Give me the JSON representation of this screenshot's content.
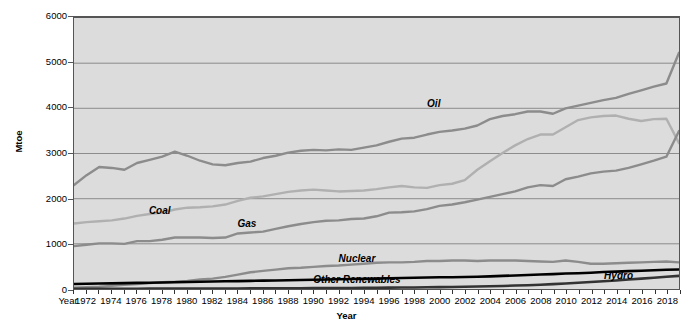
{
  "chart_data": {
    "type": "line",
    "title": "",
    "xlabel": "Year",
    "ylabel": "Mtoe",
    "xlim": [
      1971,
      2019
    ],
    "ylim": [
      0,
      6000
    ],
    "grid": true,
    "legend_position": "inline-labels",
    "background_color": "#dcdcdc",
    "y_ticks": [
      0,
      1000,
      2000,
      3000,
      4000,
      5000,
      6000
    ],
    "y_tick_labels": [
      "0",
      "1000",
      "2000",
      "3000",
      "4000",
      "5000",
      "6000"
    ],
    "x_axis_prefix_label": "Year",
    "x_tick_labels": [
      "1972",
      "1974",
      "1976",
      "1978",
      "1980",
      "1982",
      "1984",
      "1986",
      "1988",
      "1990",
      "1992",
      "1994",
      "1996",
      "1998",
      "2000",
      "2002",
      "2004",
      "2006",
      "2008",
      "2010",
      "2012",
      "2014",
      "2016",
      "2018"
    ],
    "x": [
      1971,
      1972,
      1973,
      1974,
      1975,
      1976,
      1977,
      1978,
      1979,
      1980,
      1981,
      1982,
      1983,
      1984,
      1985,
      1986,
      1987,
      1988,
      1989,
      1990,
      1991,
      1992,
      1993,
      1994,
      1995,
      1996,
      1997,
      1998,
      1999,
      2000,
      2001,
      2002,
      2003,
      2004,
      2005,
      2006,
      2007,
      2008,
      2009,
      2010,
      2011,
      2012,
      2013,
      2014,
      2015,
      2016,
      2017,
      2018,
      2019
    ],
    "series": [
      {
        "name": "Oil",
        "color": "#8c8c8c",
        "label_x": 1999,
        "label_y": 4180,
        "values": [
          2300,
          2520,
          2700,
          2680,
          2640,
          2790,
          2860,
          2930,
          3040,
          2950,
          2840,
          2760,
          2740,
          2790,
          2820,
          2900,
          2950,
          3020,
          3060,
          3080,
          3070,
          3090,
          3080,
          3130,
          3180,
          3260,
          3330,
          3350,
          3420,
          3480,
          3510,
          3550,
          3620,
          3760,
          3830,
          3870,
          3930,
          3930,
          3880,
          4000,
          4060,
          4120,
          4180,
          4230,
          4320,
          4400,
          4480,
          4550,
          5230
        ]
      },
      {
        "name": "Coal",
        "color": "#b0b0b0",
        "label_x": 1977,
        "label_y": 1830,
        "values": [
          1450,
          1480,
          1500,
          1520,
          1560,
          1620,
          1660,
          1690,
          1760,
          1800,
          1810,
          1830,
          1870,
          1950,
          2020,
          2050,
          2100,
          2150,
          2180,
          2200,
          2180,
          2160,
          2170,
          2180,
          2210,
          2250,
          2280,
          2250,
          2240,
          2300,
          2330,
          2410,
          2640,
          2830,
          3010,
          3180,
          3320,
          3420,
          3420,
          3580,
          3740,
          3800,
          3830,
          3840,
          3770,
          3720,
          3760,
          3770,
          3230
        ]
      },
      {
        "name": "Gas",
        "color": "#8c8c8c",
        "label_x": 1984,
        "label_y": 1560,
        "values": [
          950,
          980,
          1010,
          1010,
          1000,
          1060,
          1060,
          1090,
          1140,
          1140,
          1140,
          1130,
          1140,
          1230,
          1250,
          1270,
          1330,
          1390,
          1440,
          1480,
          1510,
          1520,
          1550,
          1560,
          1610,
          1690,
          1700,
          1720,
          1770,
          1840,
          1870,
          1920,
          1980,
          2040,
          2100,
          2160,
          2250,
          2300,
          2280,
          2430,
          2490,
          2560,
          2600,
          2620,
          2680,
          2760,
          2840,
          2930,
          3500
        ]
      },
      {
        "name": "Nuclear",
        "color": "#8c8c8c",
        "label_x": 1992,
        "label_y": 800,
        "values": [
          30,
          40,
          50,
          70,
          90,
          110,
          130,
          150,
          160,
          180,
          210,
          230,
          270,
          320,
          370,
          400,
          430,
          460,
          470,
          490,
          510,
          520,
          540,
          560,
          580,
          590,
          590,
          600,
          620,
          620,
          630,
          630,
          620,
          630,
          630,
          630,
          620,
          610,
          600,
          630,
          600,
          560,
          560,
          570,
          580,
          590,
          600,
          610,
          590
        ]
      },
      {
        "name": "Hydro",
        "color": "#000000",
        "label_x": 2013,
        "label_y": 420,
        "values": [
          110,
          115,
          120,
          125,
          130,
          135,
          140,
          145,
          150,
          155,
          160,
          165,
          170,
          175,
          180,
          185,
          190,
          195,
          200,
          205,
          210,
          215,
          220,
          225,
          230,
          240,
          245,
          250,
          255,
          260,
          260,
          265,
          270,
          280,
          290,
          300,
          310,
          320,
          330,
          345,
          350,
          360,
          375,
          385,
          395,
          405,
          415,
          425,
          430
        ]
      },
      {
        "name": "Other Renewables",
        "color": "#333333",
        "label_x": 1990,
        "label_y": 330,
        "values": [
          5,
          5,
          6,
          6,
          7,
          7,
          8,
          8,
          9,
          10,
          10,
          11,
          12,
          13,
          14,
          15,
          16,
          17,
          18,
          19,
          21,
          22,
          24,
          26,
          28,
          30,
          32,
          35,
          38,
          42,
          46,
          50,
          55,
          61,
          68,
          76,
          85,
          96,
          108,
          122,
          138,
          155,
          172,
          190,
          210,
          230,
          250,
          270,
          290
        ]
      }
    ]
  }
}
